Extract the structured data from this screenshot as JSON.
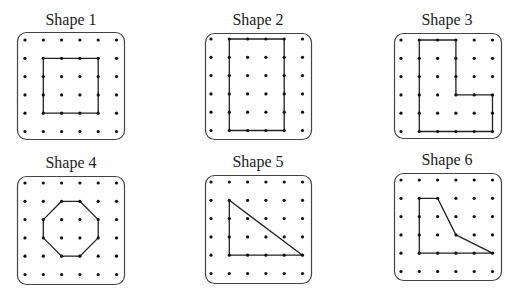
{
  "grid": {
    "cols": 6,
    "rows": 6,
    "step": 18.3
  },
  "colors": {
    "board_stroke": "#444444",
    "dot": "#111111",
    "shape_stroke": "#222222",
    "text": "#222222"
  },
  "shapes": [
    {
      "label": "Shape 1",
      "board": {
        "x": 17,
        "y": 32,
        "w": 107,
        "h": 107
      },
      "origin": {
        "x": 25,
        "y": 40
      },
      "vertices": [
        [
          1,
          1
        ],
        [
          4,
          1
        ],
        [
          4,
          4
        ],
        [
          1,
          4
        ]
      ],
      "type": "square"
    },
    {
      "label": "Shape 2",
      "board": {
        "x": 205,
        "y": 33,
        "w": 106,
        "h": 106
      },
      "origin": {
        "x": 211,
        "y": 39
      },
      "vertices": [
        [
          1,
          0
        ],
        [
          4,
          0
        ],
        [
          4,
          5
        ],
        [
          1,
          5
        ]
      ],
      "type": "rectangle"
    },
    {
      "label": "Shape 3",
      "board": {
        "x": 394,
        "y": 33,
        "w": 107,
        "h": 105
      },
      "origin": {
        "x": 401,
        "y": 40
      },
      "vertices": [
        [
          1,
          0
        ],
        [
          3,
          0
        ],
        [
          3,
          3
        ],
        [
          5,
          3
        ],
        [
          5,
          5
        ],
        [
          1,
          5
        ]
      ],
      "type": "L-shape hexagon"
    },
    {
      "label": "Shape 4",
      "board": {
        "x": 17,
        "y": 176,
        "w": 107,
        "h": 108
      },
      "origin": {
        "x": 25,
        "y": 183
      },
      "vertices": [
        [
          2,
          1
        ],
        [
          3,
          1
        ],
        [
          4,
          2
        ],
        [
          4,
          3
        ],
        [
          3,
          4
        ],
        [
          2,
          4
        ],
        [
          1,
          3
        ],
        [
          1,
          2
        ]
      ],
      "type": "octagon"
    },
    {
      "label": "Shape 5",
      "board": {
        "x": 205,
        "y": 175,
        "w": 106,
        "h": 108
      },
      "origin": {
        "x": 211,
        "y": 182
      },
      "vertices": [
        [
          1,
          1
        ],
        [
          5,
          4
        ],
        [
          1,
          4
        ]
      ],
      "type": "right triangle"
    },
    {
      "label": "Shape 6",
      "board": {
        "x": 394,
        "y": 173,
        "w": 107,
        "h": 107
      },
      "origin": {
        "x": 401,
        "y": 180
      },
      "vertices": [
        [
          1,
          1
        ],
        [
          2,
          1
        ],
        [
          3,
          3
        ],
        [
          5,
          4
        ],
        [
          1,
          4
        ]
      ],
      "type": "pentagon"
    }
  ]
}
